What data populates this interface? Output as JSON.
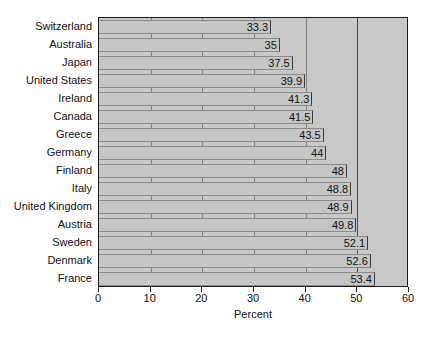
{
  "chart_data": {
    "type": "bar",
    "orientation": "horizontal",
    "title": "",
    "subtitle": "",
    "xlabel": "Percent",
    "ylabel": "",
    "xlim": [
      0,
      60
    ],
    "ylim": [],
    "grid": true,
    "legend": null,
    "legend_position": "none",
    "xticks": [
      0,
      10,
      20,
      30,
      40,
      50,
      60
    ],
    "categories": [
      "Switzerland",
      "Australia",
      "Japan",
      "United States",
      "Ireland",
      "Canada",
      "Greece",
      "Germany",
      "Finland",
      "Italy",
      "United Kingdom",
      "Austria",
      "Sweden",
      "Denmark",
      "France"
    ],
    "values": [
      33.3,
      35,
      37.5,
      39.9,
      41.3,
      41.5,
      43.5,
      44,
      48,
      48.8,
      48.9,
      49.8,
      52.1,
      52.6,
      53.4
    ],
    "value_labels": [
      "33.3",
      "35",
      "37.5",
      "39.9",
      "41.3",
      "41.5",
      "43.5",
      "44",
      "48",
      "48.8",
      "48.9",
      "49.8",
      "52.1",
      "52.6",
      "53.4"
    ]
  },
  "style": {
    "plot_background": "#c8c8c8",
    "bar_fill": "#c6c6c6",
    "bar_edge": "#3a3a3a",
    "frame_color": "#1c1c1c",
    "page_background": "#ffffff",
    "text_color": "#111111"
  }
}
